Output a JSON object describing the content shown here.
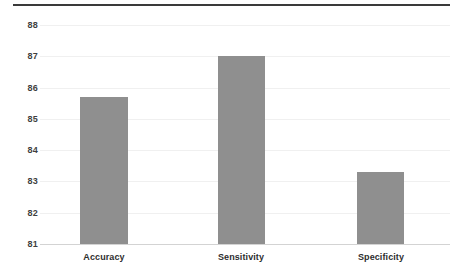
{
  "chart_data": {
    "type": "bar",
    "title": "",
    "subtitle": "",
    "xlabel": "",
    "ylabel": "",
    "categories": [
      "Accuracy",
      "Sensitivity",
      "Specificity"
    ],
    "values": [
      85.7,
      87.0,
      83.3
    ],
    "ylim": [
      81,
      88
    ],
    "yticks": [
      81,
      82,
      83,
      84,
      85,
      86,
      87,
      88
    ],
    "ytick_labels": [
      "81",
      "82",
      "83",
      "84",
      "85",
      "86",
      "87",
      "88"
    ],
    "grid": true,
    "legend": null,
    "legend_position": "none",
    "bar_color": "#8f8f8f",
    "axis_color": "#d3d3d3",
    "top_rule_color": "#3a3a3a",
    "label_color": "#2e2e2e",
    "tick_color": "#3f3f3f",
    "background": "#ffffff"
  }
}
